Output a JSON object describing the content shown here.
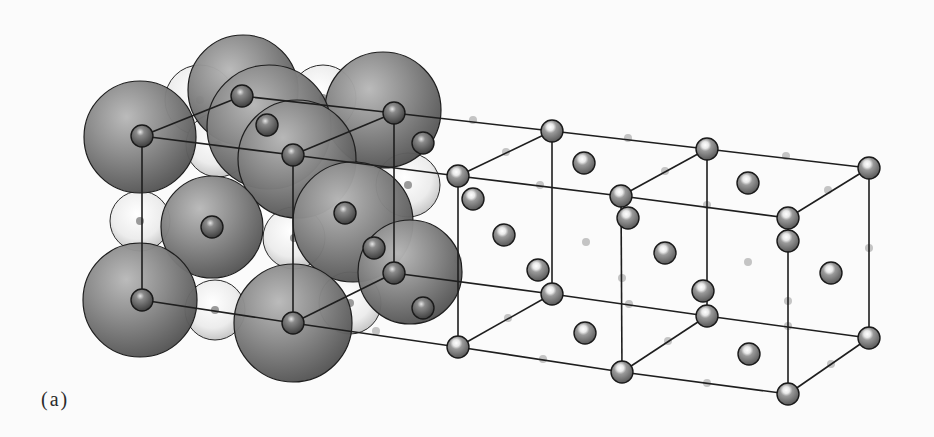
{
  "figure": {
    "panel_label": "(a)",
    "colors": {
      "background": "#fbfbfb",
      "large_ion": "#7a7a7a",
      "large_ion_highlight": "#b4b4b4",
      "small_ion_light": "#f2f2f2",
      "small_ion_center": "#6e6e6e",
      "lattice_ion": "#8c8c8c",
      "lattice_line": "#1e1e1e",
      "ghost_dot": "#c4c4c4"
    },
    "space_filling": {
      "large_spheres": [
        {
          "cx": 243,
          "cy": 90,
          "r": 55
        },
        {
          "cx": 383,
          "cy": 110,
          "r": 58
        },
        {
          "cx": 140,
          "cy": 137,
          "r": 56
        },
        {
          "cx": 269,
          "cy": 127,
          "r": 62
        },
        {
          "cx": 297,
          "cy": 159,
          "r": 59
        },
        {
          "cx": 353,
          "cy": 222,
          "r": 60
        },
        {
          "cx": 212,
          "cy": 227,
          "r": 51
        },
        {
          "cx": 410,
          "cy": 272,
          "r": 52
        },
        {
          "cx": 140,
          "cy": 300,
          "r": 57
        },
        {
          "cx": 293,
          "cy": 323,
          "r": 59
        }
      ],
      "light_spheres": [
        {
          "cx": 200,
          "cy": 100,
          "r": 35
        },
        {
          "cx": 323,
          "cy": 98,
          "r": 33
        },
        {
          "cx": 218,
          "cy": 145,
          "r": 32
        },
        {
          "cx": 408,
          "cy": 185,
          "r": 32
        },
        {
          "cx": 140,
          "cy": 221,
          "r": 30
        },
        {
          "cx": 294,
          "cy": 238,
          "r": 31
        },
        {
          "cx": 215,
          "cy": 310,
          "r": 30
        },
        {
          "cx": 350,
          "cy": 303,
          "r": 31
        }
      ]
    },
    "lattice": {
      "nodes": [
        {
          "x": 142,
          "y": 136
        },
        {
          "x": 242,
          "y": 96
        },
        {
          "x": 394,
          "y": 113
        },
        {
          "x": 293,
          "y": 155
        },
        {
          "x": 142,
          "y": 300
        },
        {
          "x": 293,
          "y": 323
        },
        {
          "x": 394,
          "y": 273
        },
        {
          "x": 458,
          "y": 176
        },
        {
          "x": 552,
          "y": 131
        },
        {
          "x": 621,
          "y": 196
        },
        {
          "x": 707,
          "y": 149
        },
        {
          "x": 788,
          "y": 218
        },
        {
          "x": 869,
          "y": 168
        },
        {
          "x": 458,
          "y": 347
        },
        {
          "x": 552,
          "y": 294
        },
        {
          "x": 622,
          "y": 372
        },
        {
          "x": 707,
          "y": 316
        },
        {
          "x": 788,
          "y": 394
        },
        {
          "x": 869,
          "y": 338
        }
      ],
      "edges": [
        [
          0,
          1
        ],
        [
          1,
          2
        ],
        [
          0,
          3
        ],
        [
          2,
          3
        ],
        [
          0,
          4
        ],
        [
          3,
          5
        ],
        [
          4,
          5
        ],
        [
          5,
          6
        ],
        [
          2,
          6
        ],
        [
          3,
          7
        ],
        [
          2,
          8
        ],
        [
          7,
          8
        ],
        [
          7,
          9
        ],
        [
          8,
          10
        ],
        [
          9,
          10
        ],
        [
          9,
          11
        ],
        [
          10,
          12
        ],
        [
          11,
          12
        ],
        [
          5,
          13
        ],
        [
          6,
          14
        ],
        [
          13,
          14
        ],
        [
          13,
          15
        ],
        [
          14,
          16
        ],
        [
          15,
          16
        ],
        [
          15,
          17
        ],
        [
          16,
          18
        ],
        [
          17,
          18
        ],
        [
          7,
          13
        ],
        [
          8,
          14
        ],
        [
          9,
          15
        ],
        [
          10,
          16
        ],
        [
          11,
          17
        ],
        [
          12,
          18
        ]
      ],
      "face_center_ions": [
        {
          "x": 267,
          "y": 125
        },
        {
          "x": 423,
          "y": 143
        },
        {
          "x": 212,
          "y": 227
        },
        {
          "x": 345,
          "y": 213
        },
        {
          "x": 374,
          "y": 248
        },
        {
          "x": 423,
          "y": 308
        },
        {
          "x": 473,
          "y": 199
        },
        {
          "x": 504,
          "y": 235
        },
        {
          "x": 538,
          "y": 270
        },
        {
          "x": 584,
          "y": 163
        },
        {
          "x": 585,
          "y": 333
        },
        {
          "x": 628,
          "y": 218
        },
        {
          "x": 665,
          "y": 253
        },
        {
          "x": 703,
          "y": 291
        },
        {
          "x": 748,
          "y": 183
        },
        {
          "x": 749,
          "y": 354
        },
        {
          "x": 788,
          "y": 241
        },
        {
          "x": 831,
          "y": 273
        }
      ],
      "ghost_dots": [
        {
          "x": 216,
          "y": 144
        },
        {
          "x": 141,
          "y": 217
        },
        {
          "x": 294,
          "y": 237
        },
        {
          "x": 216,
          "y": 310
        },
        {
          "x": 376,
          "y": 331
        },
        {
          "x": 473,
          "y": 120
        },
        {
          "x": 506,
          "y": 152
        },
        {
          "x": 540,
          "y": 185
        },
        {
          "x": 628,
          "y": 138
        },
        {
          "x": 665,
          "y": 171
        },
        {
          "x": 707,
          "y": 205
        },
        {
          "x": 786,
          "y": 156
        },
        {
          "x": 828,
          "y": 190
        },
        {
          "x": 869,
          "y": 248
        },
        {
          "x": 458,
          "y": 260
        },
        {
          "x": 586,
          "y": 242
        },
        {
          "x": 748,
          "y": 262
        },
        {
          "x": 622,
          "y": 278
        },
        {
          "x": 788,
          "y": 301
        },
        {
          "x": 508,
          "y": 318
        },
        {
          "x": 629,
          "y": 304
        },
        {
          "x": 668,
          "y": 341
        },
        {
          "x": 788,
          "y": 326
        },
        {
          "x": 831,
          "y": 364
        },
        {
          "x": 543,
          "y": 359
        },
        {
          "x": 707,
          "y": 383
        }
      ]
    }
  }
}
